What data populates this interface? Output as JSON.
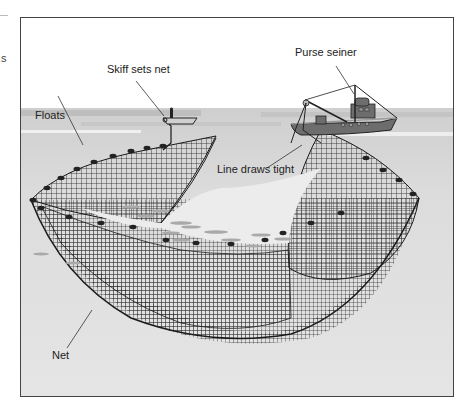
{
  "figure": {
    "labels": {
      "skiff": "Skiff sets net",
      "purse_seiner": "Purse seiner",
      "floats": "Floats",
      "line": "Line draws tight",
      "net": "Net"
    },
    "margin_artifact_char": "s",
    "colors": {
      "sky": "#ffffff",
      "water_surface": "#cfcfcf",
      "water_body": "#e3e3e3",
      "net": "#1f1f1f",
      "boat": "#6d6d6d",
      "frame": "#444444",
      "fish": "#a9a9a9"
    }
  }
}
